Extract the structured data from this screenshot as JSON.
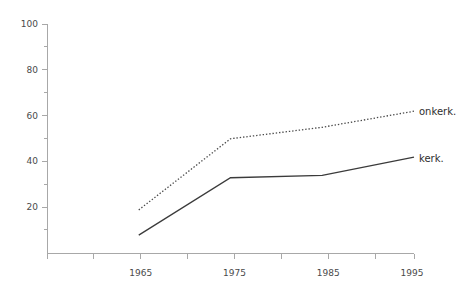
{
  "chart_data": {
    "type": "line",
    "title": "",
    "subtitle": "",
    "xlabel": "",
    "ylabel": "",
    "x": [
      1965,
      1975,
      1985,
      1995
    ],
    "categories": [
      "1965",
      "1975",
      "1985",
      "1995"
    ],
    "xlim": [
      1955,
      1995
    ],
    "ylim": [
      0,
      100
    ],
    "grid": false,
    "legend_position": "right-inline-end-of-line",
    "series": [
      {
        "name": "onkerk.",
        "style": "dotted",
        "color": "#4a4a4a",
        "values": [
          19,
          50,
          55,
          62
        ]
      },
      {
        "name": "kerk.",
        "style": "solid",
        "color": "#3b3b3b",
        "values": [
          8,
          33,
          34,
          42
        ]
      }
    ],
    "y_axis": {
      "min": 0,
      "max": 100,
      "major_ticks": [
        20,
        40,
        60,
        80,
        100
      ],
      "major_tick_labels": [
        "20",
        "40",
        "60",
        "80",
        "100"
      ],
      "minor_ticks": [
        10,
        30,
        50,
        70,
        90
      ]
    },
    "x_axis": {
      "min": 1955,
      "max": 1995,
      "tick_values": [
        1955,
        1960,
        1965,
        1970,
        1975,
        1980,
        1985,
        1990,
        1995
      ],
      "labeled_ticks": [
        1965,
        1975,
        1985,
        1995
      ],
      "tick_labels": [
        "1965",
        "1975",
        "1985",
        "1995"
      ]
    },
    "colors": {
      "axis": "#a8a8a8",
      "text": "#4a4a4a",
      "series_solid": "#3b3b3b",
      "series_dotted": "#4a4a4a",
      "background": "#ffffff"
    }
  },
  "axis_labels": {
    "y": {
      "t100": "100",
      "t80": "80",
      "t60": "60",
      "t40": "40",
      "t20": "20"
    },
    "x": {
      "t1965": "1965",
      "t1975": "1975",
      "t1985": "1985",
      "t1995": "1995"
    }
  },
  "series_labels": {
    "onkerkelijk": "onkerk.",
    "kerkelijk": "kerk."
  }
}
